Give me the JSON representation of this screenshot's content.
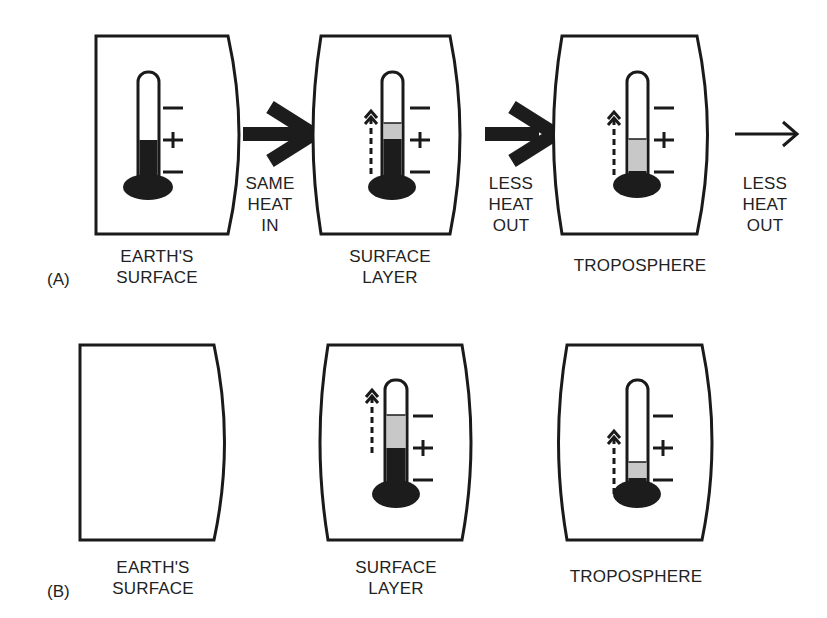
{
  "figure": {
    "rows": [
      {
        "tag": "(A)",
        "panels": [
          {
            "label_line1": "EARTH'S",
            "label_line2": "SURFACE",
            "thermometer": {
              "level": "plus",
              "gray_band": "none",
              "rise_arrow": false
            }
          },
          {
            "label_line1": "SURFACE",
            "label_line2": "LAYER",
            "thermometer": {
              "level": "plus",
              "gray_band": "small-above-plus",
              "rise_arrow": true
            }
          },
          {
            "label_line1": "TROPOSPHERE",
            "label_line2": "",
            "thermometer": {
              "level": "lower-minus",
              "gray_band": "lower-minus-to-plus",
              "rise_arrow": true
            }
          }
        ],
        "arrows": [
          {
            "style": "thick",
            "label_line1": "SAME",
            "label_line2": "HEAT",
            "label_line3": "IN"
          },
          {
            "style": "thick",
            "label_line1": "LESS",
            "label_line2": "HEAT",
            "label_line3": "OUT"
          },
          {
            "style": "thin",
            "label_line1": "LESS",
            "label_line2": "HEAT",
            "label_line3": "OUT"
          }
        ]
      },
      {
        "tag": "(B)",
        "panels": [
          {
            "label_line1": "EARTH'S",
            "label_line2": "SURFACE",
            "thermometer": null
          },
          {
            "label_line1": "SURFACE",
            "label_line2": "LAYER",
            "thermometer": {
              "level": "plus",
              "gray_band": "plus-to-upper-minus",
              "rise_arrow": true
            }
          },
          {
            "label_line1": "TROPOSPHERE",
            "label_line2": "",
            "thermometer": {
              "level": "lower-minus",
              "gray_band": "small-above-lower-minus",
              "rise_arrow": true
            }
          }
        ]
      }
    ],
    "scale_marks": [
      "−",
      "+",
      "−"
    ],
    "colors": {
      "ink": "#1a1a1a",
      "fill_dark": "#1c1c1c",
      "fill_gray": "#c8c8c8",
      "background": "#ffffff"
    }
  }
}
